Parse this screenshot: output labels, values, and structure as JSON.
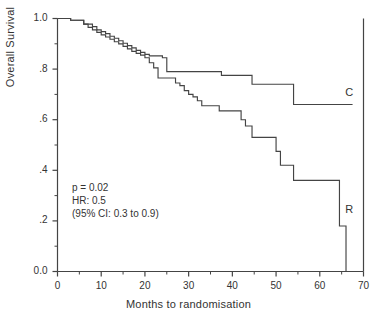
{
  "chart_data": {
    "type": "line",
    "subtype": "kaplan-meier-step",
    "title": "",
    "xlabel": "Months to randomisation",
    "ylabel": "Overall Survival",
    "xlim": [
      0,
      70
    ],
    "ylim": [
      0.0,
      1.0
    ],
    "xticks": [
      0,
      10,
      20,
      30,
      40,
      50,
      60,
      70
    ],
    "xtick_labels": [
      "0",
      "10",
      "20",
      "30",
      "40",
      "50",
      "60",
      "70"
    ],
    "xminor_ticks": [
      5,
      15,
      25,
      35,
      45,
      55,
      65
    ],
    "yticks": [
      0.0,
      0.2,
      0.4,
      0.6,
      0.8,
      1.0
    ],
    "ytick_labels": [
      "0.0",
      ".2",
      ".4",
      ".6",
      ".8",
      "1.0"
    ],
    "yminor_ticks": [
      0.1,
      0.3,
      0.5,
      0.7,
      0.9
    ],
    "grid": false,
    "legend_position": "inline-right-of-curve-end",
    "line_color": "#444444",
    "axis_color": "#444444",
    "background": "#ffffff",
    "series": [
      {
        "name": "C",
        "label": "C",
        "label_x": 66.5,
        "label_y": 0.705,
        "color": "#444444",
        "points": [
          [
            0,
            1.0
          ],
          [
            2,
            1.0
          ],
          [
            3,
            0.993
          ],
          [
            5,
            0.993
          ],
          [
            6,
            0.978
          ],
          [
            8,
            0.968
          ],
          [
            9,
            0.955
          ],
          [
            10,
            0.948
          ],
          [
            11,
            0.94
          ],
          [
            12,
            0.93
          ],
          [
            13,
            0.922
          ],
          [
            14,
            0.912
          ],
          [
            15,
            0.902
          ],
          [
            16,
            0.893
          ],
          [
            17,
            0.884
          ],
          [
            18,
            0.874
          ],
          [
            19,
            0.866
          ],
          [
            20,
            0.858
          ],
          [
            21,
            0.852
          ],
          [
            23,
            0.852
          ],
          [
            24,
            0.845
          ],
          [
            25,
            0.79
          ],
          [
            37,
            0.79
          ],
          [
            37.5,
            0.775
          ],
          [
            44,
            0.775
          ],
          [
            44.5,
            0.74
          ],
          [
            53.5,
            0.74
          ],
          [
            54,
            0.66
          ],
          [
            67.5,
            0.66
          ]
        ]
      },
      {
        "name": "R",
        "label": "R",
        "label_x": 66.5,
        "label_y": 0.245,
        "color": "#444444",
        "points": [
          [
            0,
            1.0
          ],
          [
            2,
            1.0
          ],
          [
            3,
            0.993
          ],
          [
            5,
            0.993
          ],
          [
            6,
            0.978
          ],
          [
            7,
            0.965
          ],
          [
            8,
            0.955
          ],
          [
            9,
            0.945
          ],
          [
            10,
            0.935
          ],
          [
            11,
            0.927
          ],
          [
            12,
            0.918
          ],
          [
            13,
            0.908
          ],
          [
            14,
            0.9
          ],
          [
            15,
            0.89
          ],
          [
            16,
            0.88
          ],
          [
            17,
            0.87
          ],
          [
            18,
            0.862
          ],
          [
            19,
            0.855
          ],
          [
            20,
            0.845
          ],
          [
            21,
            0.825
          ],
          [
            22,
            0.805
          ],
          [
            23,
            0.765
          ],
          [
            26,
            0.765
          ],
          [
            27,
            0.745
          ],
          [
            28,
            0.735
          ],
          [
            29,
            0.715
          ],
          [
            30,
            0.7
          ],
          [
            31,
            0.69
          ],
          [
            32,
            0.675
          ],
          [
            33,
            0.655
          ],
          [
            36,
            0.655
          ],
          [
            37,
            0.635
          ],
          [
            41.5,
            0.635
          ],
          [
            42,
            0.6
          ],
          [
            43,
            0.575
          ],
          [
            44.5,
            0.53
          ],
          [
            49.5,
            0.53
          ],
          [
            50,
            0.475
          ],
          [
            51,
            0.42
          ],
          [
            53.5,
            0.42
          ],
          [
            54,
            0.36
          ],
          [
            64,
            0.36
          ],
          [
            64.5,
            0.18
          ],
          [
            66,
            0.18
          ],
          [
            66,
            0.0
          ]
        ]
      }
    ],
    "annotations": [
      {
        "id": "p-value",
        "text": "p = 0.02"
      },
      {
        "id": "hazard-ratio",
        "text": "HR: 0.5"
      },
      {
        "id": "confidence-interval",
        "text": "(95% CI: 0.3 to 0.9)"
      }
    ]
  }
}
